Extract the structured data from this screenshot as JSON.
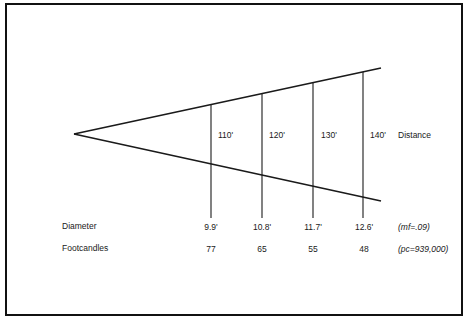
{
  "diagram": {
    "axis_label": "Distance",
    "distances": [
      "110'",
      "120'",
      "130'",
      "140'"
    ],
    "rows": {
      "diameter": {
        "label": "Diameter",
        "values": [
          "9.9'",
          "10.8'",
          "11.7'",
          "12.6'"
        ],
        "note": "(mf=.09)"
      },
      "footcandles": {
        "label": "Footcandles",
        "values": [
          "77",
          "65",
          "55",
          "48"
        ],
        "note": "(pc=939,000)"
      }
    },
    "colors": {
      "line": "#1a1a1a",
      "frame": "#111111",
      "background": "#ffffff"
    }
  }
}
